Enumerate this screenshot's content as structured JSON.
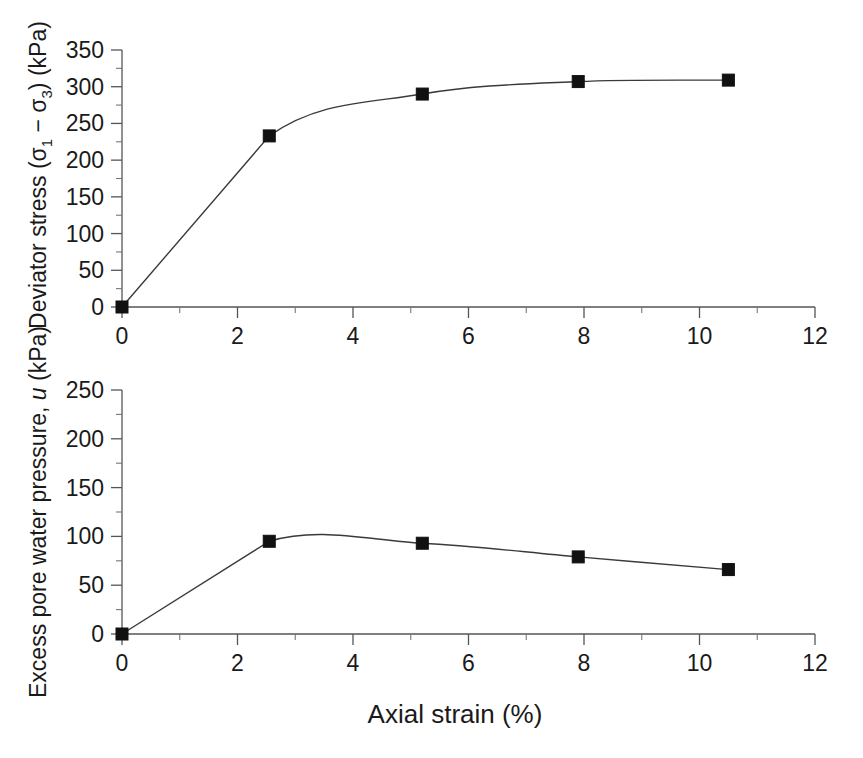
{
  "figure": {
    "background": "#ffffff",
    "line_color": "#3a3a3a",
    "marker_color": "#111111",
    "axis_color": "#555555"
  },
  "shared_x_axis": {
    "label": "Axial strain (%)",
    "min": 0,
    "max": 12,
    "major_step": 2,
    "minor_step": 1,
    "tick_labels": [
      "0",
      "2",
      "4",
      "6",
      "8",
      "10",
      "12"
    ]
  },
  "top_panel": {
    "y_axis": {
      "title_main": "Deviator stress (",
      "title_sigma1": "σ",
      "title_sub1": "1",
      "title_minus": " − ",
      "title_sigma3": "σ",
      "title_sub3": "3",
      "title_tail": ") (kPa)",
      "min": 0,
      "max": 350,
      "major_step": 50,
      "minor_step": 25,
      "tick_labels": [
        "0",
        "50",
        "100",
        "150",
        "200",
        "250",
        "300",
        "350"
      ]
    }
  },
  "bottom_panel": {
    "y_axis": {
      "title_prefix": "Excess pore water pressure, ",
      "title_symbol": "u",
      "title_suffix": " (kPa)",
      "min": 0,
      "max": 250,
      "major_step": 50,
      "minor_step": 25,
      "tick_labels": [
        "0",
        "50",
        "100",
        "150",
        "200",
        "250"
      ]
    }
  },
  "chart_data": [
    {
      "type": "line",
      "panel": "top",
      "title": "",
      "xlabel": "Axial strain (%)",
      "ylabel": "Deviator stress (σ₁ − σ₃) (kPa)",
      "xlim": [
        0,
        12
      ],
      "ylim": [
        0,
        350
      ],
      "grid": false,
      "legend": "none",
      "marker": "filled-square",
      "series": [
        {
          "name": "Deviator stress",
          "x": [
            0,
            2.55,
            5.2,
            7.9,
            10.5
          ],
          "y": [
            0,
            233,
            290,
            307,
            309
          ]
        }
      ]
    },
    {
      "type": "line",
      "panel": "bottom",
      "title": "",
      "xlabel": "Axial strain (%)",
      "ylabel": "Excess pore water pressure, u (kPa)",
      "xlim": [
        0,
        12
      ],
      "ylim": [
        0,
        250
      ],
      "grid": false,
      "legend": "none",
      "marker": "filled-square",
      "series": [
        {
          "name": "Excess pore water pressure",
          "x": [
            0,
            2.55,
            5.2,
            7.9,
            10.5
          ],
          "y": [
            0,
            95,
            93,
            79,
            66
          ]
        }
      ]
    }
  ]
}
